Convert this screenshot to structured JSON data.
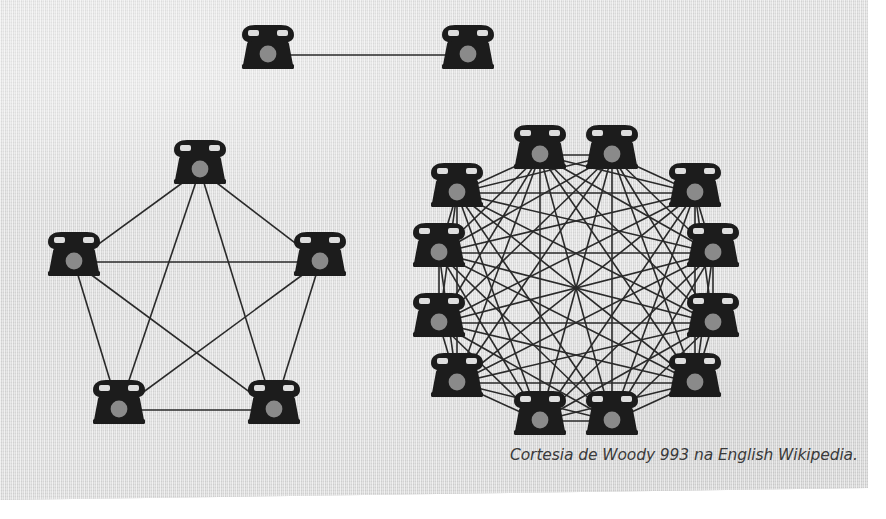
{
  "figure": {
    "caption": "Cortesia de Woody 993 na English Wikipedia.",
    "background_color": "#dedede",
    "ink_color": "#2a2a2a",
    "dial_color": "#8a8a8a",
    "page_color": "#ffffff",
    "node_icon_name": "rotary-telephone-icon"
  },
  "chart_data": {
    "type": "diagram",
    "subtype": "complete-graph-network",
    "grid": false,
    "legend": false,
    "node_glyph": "rotary-telephone",
    "graphs": [
      {
        "id": "pair",
        "name": "two-phone-network",
        "node_count": 2,
        "edge_count": 1,
        "layout": "horizontal-pair",
        "center": [
          370,
          55
        ],
        "radius": 105,
        "phone_scale": 1.0,
        "nodes": [
          {
            "index": 0,
            "x": 268,
            "y": 55
          },
          {
            "index": 1,
            "x": 468,
            "y": 55
          }
        ],
        "edges": [
          [
            0,
            1
          ]
        ]
      },
      {
        "id": "pentagon",
        "name": "five-phone-network",
        "node_count": 5,
        "edge_count": 10,
        "layout": "regular-polygon",
        "center": [
          200,
          297
        ],
        "radius": 130,
        "start_angle_deg": -90,
        "phone_scale": 1.0,
        "nodes": [
          {
            "index": 0,
            "x": 200,
            "y": 170
          },
          {
            "index": 1,
            "x": 320,
            "y": 262
          },
          {
            "index": 2,
            "x": 274,
            "y": 410
          },
          {
            "index": 3,
            "x": 119,
            "y": 410
          },
          {
            "index": 4,
            "x": 74,
            "y": 262
          }
        ],
        "edges": [
          [
            0,
            1
          ],
          [
            0,
            2
          ],
          [
            0,
            3
          ],
          [
            0,
            4
          ],
          [
            1,
            2
          ],
          [
            1,
            3
          ],
          [
            1,
            4
          ],
          [
            2,
            3
          ],
          [
            2,
            4
          ],
          [
            3,
            4
          ]
        ]
      },
      {
        "id": "dodecagon",
        "name": "twelve-phone-network",
        "node_count": 12,
        "edge_count": 66,
        "layout": "regular-polygon",
        "center": [
          576,
          288
        ],
        "radius": 138,
        "start_angle_deg": -75,
        "phone_scale": 1.0,
        "nodes": [
          {
            "index": 0,
            "x": 612,
            "y": 155
          },
          {
            "index": 1,
            "x": 695,
            "y": 193
          },
          {
            "index": 2,
            "x": 713,
            "y": 253
          },
          {
            "index": 3,
            "x": 713,
            "y": 323
          },
          {
            "index": 4,
            "x": 695,
            "y": 383
          },
          {
            "index": 5,
            "x": 612,
            "y": 421
          },
          {
            "index": 6,
            "x": 540,
            "y": 421
          },
          {
            "index": 7,
            "x": 457,
            "y": 383
          },
          {
            "index": 8,
            "x": 439,
            "y": 323
          },
          {
            "index": 9,
            "x": 439,
            "y": 253
          },
          {
            "index": 10,
            "x": 457,
            "y": 193
          },
          {
            "index": 11,
            "x": 540,
            "y": 155
          }
        ],
        "edges_rule": "complete",
        "note": "Every node is connected to every other node (K12)."
      }
    ],
    "annotations": [
      {
        "name": "caption",
        "text": "Cortesia de Woody 993 na English Wikipedia.",
        "x": 855,
        "y": 458,
        "align": "right",
        "style": "italic"
      }
    ]
  }
}
